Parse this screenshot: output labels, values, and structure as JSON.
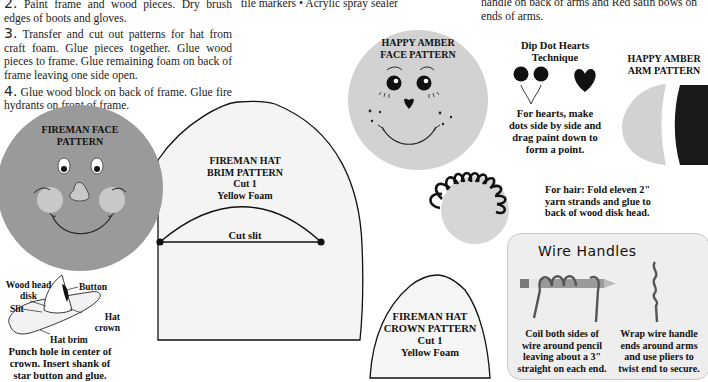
{
  "instructions": {
    "steps": [
      {
        "number": "2.",
        "text": "Paint frame and wood pieces. Dry brush edges of boots and gloves."
      },
      {
        "number": "3.",
        "text": "Transfer and cut out patterns for hat from craft foam. Glue pieces together. Glue wood pieces to frame. Glue remaining foam on back of frame leaving one side open."
      },
      {
        "number": "4.",
        "text": "Glue wood block on back of frame. Glue fire hydrants on front of frame."
      }
    ],
    "materials_fragment": "tile markers • Acrylic spray sealer",
    "right_fragment": "handle on back of arms and Red satin bows on ends of arms."
  },
  "patterns": {
    "fireman_face": {
      "title_line1": "FIREMAN FACE",
      "title_line2": "PATTERN"
    },
    "hat_brim": {
      "line1": "FIREMAN HAT",
      "line2": "BRIM PATTERN",
      "line3": "Cut 1",
      "line4": "Yellow Foam",
      "slit_label": "Cut slit"
    },
    "hat_crown": {
      "line1": "FIREMAN HAT",
      "line2": "CROWN PATTERN",
      "line3": "Cut 1",
      "line4": "Yellow Foam"
    },
    "amber_face": {
      "title_line1": "HAPPY AMBER",
      "title_line2": "FACE PATTERN"
    },
    "amber_arm": {
      "title_line1": "HAPPY AMBER",
      "title_line2": "ARM PATTERN"
    }
  },
  "hat_diagram": {
    "labels": {
      "wood_head_disk_1": "Wood head",
      "wood_head_disk_2": "disk",
      "button": "Button",
      "slit": "Slit",
      "hat_crown_1": "Hat",
      "hat_crown_2": "crown",
      "hat_brim": "Hat brim"
    },
    "caption": [
      "Punch hole in center of",
      "crown. Insert shank of",
      "star button and glue."
    ]
  },
  "dip_dot": {
    "title_line1": "Dip Dot Hearts",
    "title_line2": "Technique",
    "caption": [
      "For hearts, make",
      "dots side by side and",
      "drag paint down to",
      "form a point."
    ]
  },
  "hair_note": [
    "For hair: Fold eleven 2\"",
    "yarn strands and glue to",
    "back of wood disk head."
  ],
  "wire_handles": {
    "title": "Wire Handles",
    "caption_left": [
      "Coil both sides of",
      "wire around pencil",
      "leaving about a 3\"",
      "straight on each end."
    ],
    "caption_right": [
      "Wrap wire handle",
      "ends around arms",
      "and use pliers to",
      "twist end to secure."
    ]
  },
  "colors": {
    "fireman_face": "#9a9a9a",
    "cheek": "#c8c8c8",
    "amber_face": "#d2d2d2",
    "pattern_fill": "#f4f4f4",
    "ink": "#111111",
    "wire_box": "#eeeeee"
  }
}
